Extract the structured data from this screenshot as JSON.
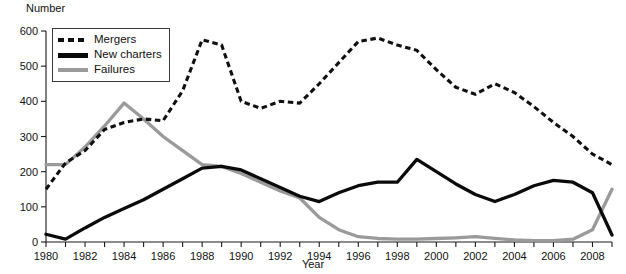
{
  "chart_data": {
    "type": "line",
    "title": "",
    "xlabel": "Year",
    "ylabel": "Number",
    "xlim": [
      1980,
      2009
    ],
    "ylim": [
      0,
      600
    ],
    "ytick_labels": [
      "0",
      "100",
      "200",
      "300",
      "400",
      "500",
      "600"
    ],
    "yticks": [
      0,
      100,
      200,
      300,
      400,
      500,
      600
    ],
    "xtick_labels": [
      "1980",
      "1982",
      "1984",
      "1986",
      "1988",
      "1990",
      "1992",
      "1994",
      "1996",
      "1998",
      "2000",
      "2002",
      "2004",
      "2006",
      "2008"
    ],
    "xticks": [
      1980,
      1982,
      1984,
      1986,
      1988,
      1990,
      1992,
      1994,
      1996,
      1998,
      2000,
      2002,
      2004,
      2006,
      2008
    ],
    "grid": false,
    "legend_position": "top-left",
    "x": [
      1980,
      1981,
      1982,
      1983,
      1984,
      1985,
      1986,
      1987,
      1988,
      1989,
      1990,
      1991,
      1992,
      1993,
      1994,
      1995,
      1996,
      1997,
      1998,
      1999,
      2000,
      2001,
      2002,
      2003,
      2004,
      2005,
      2006,
      2007,
      2008,
      2009
    ],
    "series": [
      {
        "name": "Mergers",
        "style": "dotted",
        "color": "#101010",
        "values": [
          150,
          225,
          260,
          320,
          340,
          350,
          345,
          430,
          575,
          560,
          400,
          380,
          400,
          395,
          450,
          510,
          570,
          580,
          560,
          545,
          490,
          440,
          420,
          450,
          425,
          385,
          340,
          300,
          250,
          220
        ]
      },
      {
        "name": "New charters",
        "style": "solid",
        "color": "#0a0a0a",
        "values": [
          22,
          8,
          40,
          70,
          95,
          120,
          150,
          180,
          210,
          215,
          205,
          180,
          155,
          130,
          115,
          140,
          160,
          170,
          170,
          235,
          200,
          165,
          135,
          115,
          135,
          160,
          175,
          170,
          140,
          20
        ]
      },
      {
        "name": "Failures",
        "style": "solid",
        "color": "#9a9a9a",
        "values": [
          220,
          220,
          270,
          330,
          395,
          350,
          300,
          260,
          220,
          215,
          195,
          170,
          145,
          125,
          70,
          35,
          15,
          10,
          8,
          8,
          10,
          12,
          15,
          10,
          6,
          4,
          4,
          8,
          35,
          150
        ]
      }
    ]
  },
  "legend": {
    "items": [
      {
        "label": "Mergers",
        "swatch": "dotted-black"
      },
      {
        "label": "New charters",
        "swatch": "solid-black"
      },
      {
        "label": "Failures",
        "swatch": "solid-gray"
      }
    ]
  },
  "axes": {
    "y_title": "Number",
    "x_title": "Year"
  }
}
